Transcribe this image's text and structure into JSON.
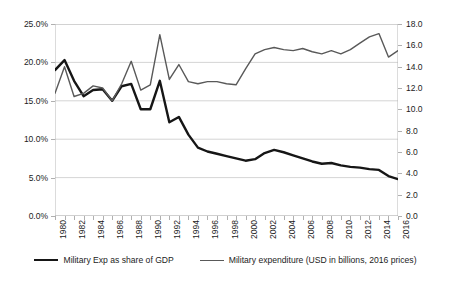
{
  "chart_data": {
    "type": "line",
    "title": "",
    "subtitle": "",
    "xlabel": "",
    "ylabel": "",
    "grid": true,
    "legend_position": "bottom",
    "x": [
      1980,
      1981,
      1982,
      1983,
      1984,
      1985,
      1986,
      1987,
      1988,
      1989,
      1990,
      1991,
      1992,
      1993,
      1994,
      1995,
      1996,
      1997,
      1998,
      1999,
      2000,
      2001,
      2002,
      2003,
      2004,
      2005,
      2006,
      2007,
      2008,
      2009,
      2010,
      2011,
      2012,
      2013,
      2014,
      2015,
      2016
    ],
    "xtick_labels": [
      "1980",
      "1982",
      "1984",
      "1986",
      "1988",
      "1990",
      "1992",
      "1994",
      "1996",
      "1998",
      "2000",
      "2002",
      "2004",
      "2006",
      "2008",
      "2010",
      "2012",
      "2014",
      "2016"
    ],
    "axes": {
      "left": {
        "label": "",
        "ylim": [
          0.0,
          25.0
        ],
        "tick_values": [
          0.0,
          5.0,
          10.0,
          15.0,
          20.0,
          25.0
        ],
        "tick_labels": [
          "0.0%",
          "5.0%",
          "10.0%",
          "15.0%",
          "20.0%",
          "25.0%"
        ],
        "unit": "percent"
      },
      "right": {
        "label": "",
        "ylim": [
          0.0,
          18.0
        ],
        "tick_values": [
          0.0,
          2.0,
          4.0,
          6.0,
          8.0,
          10.0,
          12.0,
          14.0,
          16.0,
          18.0
        ],
        "tick_labels": [
          "0.0",
          "2.0",
          "4.0",
          "6.0",
          "8.0",
          "10.0",
          "12.0",
          "14.0",
          "16.0",
          "18.0"
        ],
        "unit": "USD billions"
      }
    },
    "series": [
      {
        "name": "Military Exp as share of GDP",
        "axis": "left",
        "color": "#161616",
        "width": 2.4,
        "values": [
          19.0,
          20.3,
          17.6,
          15.6,
          16.4,
          16.5,
          15.0,
          16.9,
          17.2,
          13.9,
          13.9,
          17.6,
          12.2,
          12.9,
          10.6,
          8.9,
          8.4,
          8.1,
          7.8,
          7.5,
          7.2,
          7.4,
          8.2,
          8.6,
          8.3,
          7.9,
          7.5,
          7.1,
          6.8,
          6.9,
          6.6,
          6.4,
          6.3,
          6.1,
          6.0,
          5.2,
          4.8
        ]
      },
      {
        "name": "Military expenditure (USD in billions, 2016 prices)",
        "axis": "right",
        "color": "#595959",
        "width": 1.4,
        "values": [
          11.5,
          14.0,
          11.2,
          11.5,
          12.2,
          12.0,
          10.8,
          12.4,
          14.5,
          11.8,
          12.3,
          17.0,
          12.8,
          14.2,
          12.6,
          12.4,
          12.6,
          12.6,
          12.4,
          12.3,
          13.8,
          15.2,
          15.6,
          15.8,
          15.6,
          15.5,
          15.7,
          15.4,
          15.2,
          15.5,
          15.2,
          15.6,
          16.2,
          16.8,
          17.1,
          14.9,
          15.5
        ]
      }
    ]
  },
  "legend": {
    "items": [
      {
        "label": "Military Exp as share of GDP",
        "style": "thick"
      },
      {
        "label": "Military expenditure (USD in billions, 2016 prices)",
        "style": "thin"
      }
    ]
  }
}
